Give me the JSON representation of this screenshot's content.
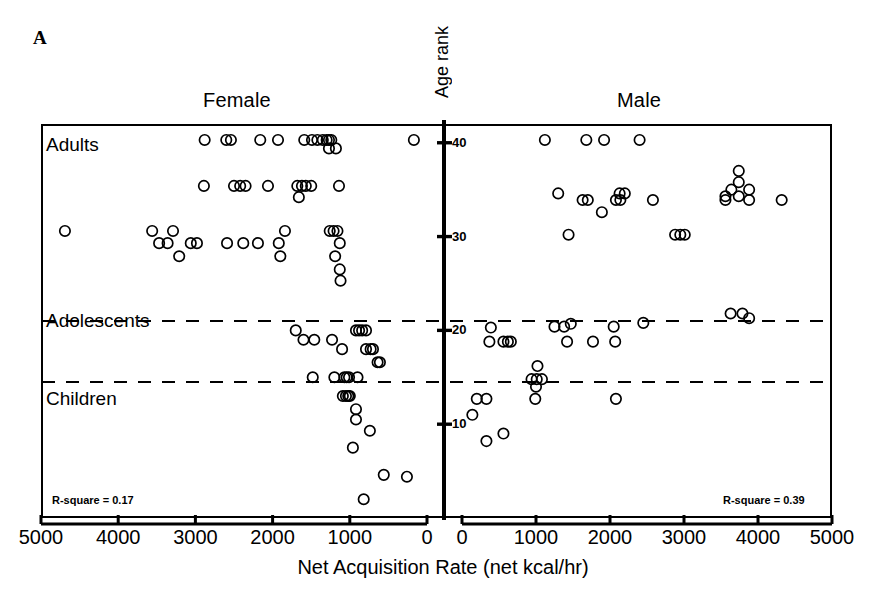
{
  "figure": {
    "panel_label": "A",
    "female_title": "Female",
    "male_title": "Male",
    "y_axis_title": "Age rank",
    "x_axis_title": "Net Acquisition Rate (net kcal/hr)",
    "category_labels": [
      "Adults",
      "Adolescents",
      "Children"
    ],
    "rsquare_female": "R-square = 0.17",
    "rsquare_male": "R-square = 0.39",
    "x_tick_labels_left": [
      "5000",
      "4000",
      "3000",
      "2000",
      "1000",
      "0"
    ],
    "x_tick_labels_right": [
      "0",
      "1000",
      "2000",
      "3000",
      "4000",
      "5000"
    ],
    "y_tick_labels": [
      "40",
      "30",
      "20",
      "10"
    ]
  },
  "chart_data": {
    "type": "scatter",
    "title": "A",
    "xlabel": "Net Acquisition Rate (net kcal/hr)",
    "ylabel": "Age rank",
    "xlim_female": [
      5000,
      0
    ],
    "xlim_male": [
      0,
      5000
    ],
    "ylim": [
      0,
      42
    ],
    "grid": false,
    "legend": null,
    "marker": "open-circle",
    "reference_lines": [
      {
        "name": "adults-adolescents-divider",
        "y": 21.0,
        "style": "dashed"
      },
      {
        "name": "adolescents-children-divider",
        "y": 14.5,
        "style": "dashed"
      }
    ],
    "y_ticks": [
      10,
      20,
      30,
      40
    ],
    "x_ticks": [
      0,
      1000,
      2000,
      3000,
      4000,
      5000
    ],
    "annotations": [
      {
        "text": "R-square = 0.17",
        "panel": "female"
      },
      {
        "text": "R-square = 0.39",
        "panel": "male"
      }
    ],
    "age_class_bands": [
      {
        "label": "Adults",
        "y_range": [
          21.0,
          42
        ]
      },
      {
        "label": "Adolescents",
        "y_range": [
          14.5,
          21.0
        ]
      },
      {
        "label": "Children",
        "y_range": [
          0,
          14.5
        ]
      }
    ],
    "series": [
      {
        "name": "Female",
        "panel": "female",
        "n": 78,
        "points": [
          [
            2880,
            40.3
          ],
          [
            2600,
            40.3
          ],
          [
            2540,
            40.3
          ],
          [
            2160,
            40.3
          ],
          [
            1930,
            40.3
          ],
          [
            1590,
            40.3
          ],
          [
            1490,
            40.3
          ],
          [
            1420,
            40.3
          ],
          [
            1350,
            40.3
          ],
          [
            1300,
            40.3
          ],
          [
            1270,
            40.3
          ],
          [
            1240,
            40.3
          ],
          [
            170,
            40.3
          ],
          [
            1270,
            39.4
          ],
          [
            1180,
            39.4
          ],
          [
            2890,
            35.4
          ],
          [
            2500,
            35.4
          ],
          [
            2420,
            35.4
          ],
          [
            2350,
            35.4
          ],
          [
            2060,
            35.4
          ],
          [
            1680,
            35.4
          ],
          [
            1620,
            35.4
          ],
          [
            1570,
            35.4
          ],
          [
            1500,
            35.4
          ],
          [
            1140,
            35.4
          ],
          [
            1660,
            34.2
          ],
          [
            4690,
            30.6
          ],
          [
            3560,
            30.6
          ],
          [
            3290,
            30.6
          ],
          [
            1840,
            30.6
          ],
          [
            1260,
            30.6
          ],
          [
            1210,
            30.6
          ],
          [
            1160,
            30.6
          ],
          [
            3470,
            29.3
          ],
          [
            3360,
            29.3
          ],
          [
            3060,
            29.3
          ],
          [
            2980,
            29.3
          ],
          [
            2590,
            29.3
          ],
          [
            2380,
            29.3
          ],
          [
            2190,
            29.3
          ],
          [
            1920,
            29.3
          ],
          [
            1130,
            29.3
          ],
          [
            3210,
            27.9
          ],
          [
            1900,
            27.9
          ],
          [
            1190,
            27.9
          ],
          [
            1130,
            26.5
          ],
          [
            1120,
            25.3
          ],
          [
            1700,
            20.0
          ],
          [
            920,
            20.0
          ],
          [
            880,
            20.0
          ],
          [
            840,
            20.0
          ],
          [
            790,
            20.0
          ],
          [
            1600,
            19.0
          ],
          [
            1460,
            19.0
          ],
          [
            1230,
            19.0
          ],
          [
            1100,
            18.0
          ],
          [
            790,
            18.0
          ],
          [
            730,
            18.0
          ],
          [
            700,
            18.0
          ],
          [
            640,
            16.6
          ],
          [
            610,
            16.6
          ],
          [
            1480,
            15.0
          ],
          [
            1200,
            15.0
          ],
          [
            1070,
            15.0
          ],
          [
            1040,
            15.0
          ],
          [
            1010,
            15.0
          ],
          [
            900,
            15.0
          ],
          [
            1090,
            13.0
          ],
          [
            1050,
            13.0
          ],
          [
            1020,
            13.0
          ],
          [
            1000,
            13.0
          ],
          [
            920,
            11.6
          ],
          [
            920,
            10.5
          ],
          [
            740,
            9.3
          ],
          [
            960,
            7.5
          ],
          [
            560,
            4.6
          ],
          [
            260,
            4.4
          ],
          [
            820,
            2.0
          ]
        ]
      },
      {
        "name": "Male",
        "panel": "male",
        "n": 47,
        "points": [
          [
            1120,
            40.3
          ],
          [
            1680,
            40.3
          ],
          [
            1920,
            40.3
          ],
          [
            2400,
            40.3
          ],
          [
            3740,
            37.0
          ],
          [
            3740,
            35.8
          ],
          [
            3640,
            35.0
          ],
          [
            3880,
            35.0
          ],
          [
            2130,
            34.6
          ],
          [
            2200,
            34.6
          ],
          [
            1300,
            34.6
          ],
          [
            3560,
            34.3
          ],
          [
            3740,
            34.3
          ],
          [
            1630,
            33.9
          ],
          [
            1700,
            33.9
          ],
          [
            2080,
            33.9
          ],
          [
            2140,
            33.9
          ],
          [
            2580,
            33.9
          ],
          [
            3560,
            33.9
          ],
          [
            3880,
            33.9
          ],
          [
            4320,
            33.9
          ],
          [
            1890,
            32.6
          ],
          [
            1440,
            30.2
          ],
          [
            2880,
            30.2
          ],
          [
            2950,
            30.2
          ],
          [
            3010,
            30.2
          ],
          [
            3630,
            21.8
          ],
          [
            3790,
            21.8
          ],
          [
            3880,
            21.3
          ],
          [
            390,
            20.3
          ],
          [
            1250,
            20.4
          ],
          [
            1380,
            20.4
          ],
          [
            1470,
            20.7
          ],
          [
            2050,
            20.4
          ],
          [
            2450,
            20.8
          ],
          [
            370,
            18.8
          ],
          [
            560,
            18.8
          ],
          [
            620,
            18.8
          ],
          [
            660,
            18.8
          ],
          [
            1420,
            18.8
          ],
          [
            1770,
            18.8
          ],
          [
            2070,
            18.8
          ],
          [
            1020,
            16.2
          ],
          [
            940,
            14.8
          ],
          [
            1010,
            14.8
          ],
          [
            1080,
            14.8
          ],
          [
            1000,
            14.0
          ],
          [
            200,
            12.7
          ],
          [
            330,
            12.7
          ],
          [
            990,
            12.7
          ],
          [
            2080,
            12.7
          ],
          [
            140,
            11.0
          ],
          [
            560,
            9.0
          ],
          [
            330,
            8.2
          ]
        ]
      }
    ]
  }
}
